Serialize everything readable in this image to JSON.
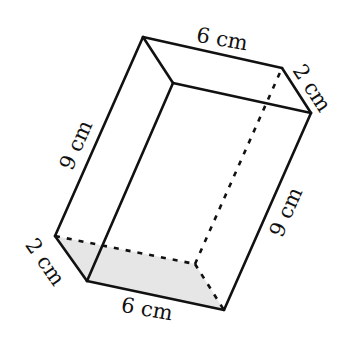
{
  "figure": {
    "type": "rectangular-prism",
    "colors": {
      "edge": "#111111",
      "shaded_face": "#e6e6e6",
      "background": "#ffffff"
    },
    "vertices": {
      "A": [
        143,
        37
      ],
      "B": [
        282,
        68
      ],
      "C": [
        311,
        113
      ],
      "D": [
        173,
        83
      ],
      "E": [
        55,
        236
      ],
      "F": [
        195,
        264
      ],
      "G": [
        224,
        310
      ],
      "H": [
        87,
        281
      ]
    },
    "shaded_face": [
      "E",
      "F",
      "G",
      "H"
    ],
    "solid_edges": [
      [
        "A",
        "B"
      ],
      [
        "B",
        "C"
      ],
      [
        "C",
        "D"
      ],
      [
        "D",
        "A"
      ],
      [
        "A",
        "E"
      ],
      [
        "E",
        "H"
      ],
      [
        "H",
        "G"
      ],
      [
        "G",
        "C"
      ],
      [
        "D",
        "H"
      ]
    ],
    "hidden_edges": [
      [
        "E",
        "F"
      ],
      [
        "F",
        "G"
      ],
      [
        "F",
        "B"
      ]
    ]
  },
  "labels": {
    "top_length": "6 cm",
    "top_depth": "2 cm",
    "left_height": "9 cm",
    "right_height": "9 cm",
    "bottom_depth": "2 cm",
    "bottom_length": "6 cm"
  }
}
